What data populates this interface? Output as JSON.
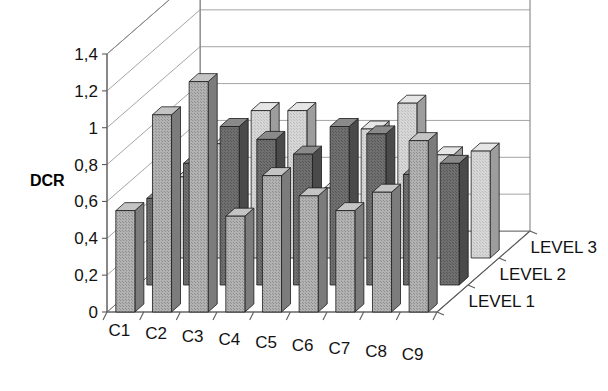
{
  "chart_data": {
    "type": "bar",
    "subtype": "3d-grouped-bar",
    "title": "",
    "xlabel": "",
    "ylabel": "DCR",
    "ylim": [
      0,
      1.4
    ],
    "ytick_labels": [
      "0",
      "0,2",
      "0,4",
      "0,6",
      "0,8",
      "1",
      "1,2",
      "1,4"
    ],
    "ytick_values": [
      0,
      0.2,
      0.4,
      0.6,
      0.8,
      1.0,
      1.2,
      1.4
    ],
    "grid": true,
    "grid_axis": "y",
    "legend_position": "depth-axis-right",
    "decimal_separator": ",",
    "categories": [
      "C1",
      "C2",
      "C3",
      "C4",
      "C5",
      "C6",
      "C7",
      "C8",
      "C9"
    ],
    "depth_categories": [
      "LEVEL 1",
      "LEVEL 2",
      "LEVEL 3"
    ],
    "series": [
      {
        "name": "LEVEL 1",
        "color": "#a8a8a8",
        "values": [
          0.55,
          1.07,
          1.25,
          0.52,
          0.74,
          0.63,
          0.55,
          0.65,
          0.93
        ]
      },
      {
        "name": "LEVEL 2",
        "color": "#6b6b6b",
        "values": [
          0.47,
          0.66,
          0.86,
          0.79,
          0.71,
          0.86,
          0.82,
          0.6,
          0.66
        ]
      },
      {
        "name": "LEVEL 3",
        "color": "#cfcfcf",
        "values": [
          0.44,
          0.62,
          0.8,
          0.8,
          0.38,
          0.7,
          0.84,
          0.56,
          0.58
        ]
      }
    ]
  },
  "axis": {
    "value_axis_title": "DCR"
  },
  "style": {
    "background": "#ffffff",
    "grid_color": "#8d8d8d",
    "axis_color": "#5d5d5d",
    "bar_outline": "#1c1c1c",
    "level1_fill": "#a8a8a8",
    "level2_fill": "#6b6b6b",
    "level3_fill": "#cfcfcf"
  }
}
